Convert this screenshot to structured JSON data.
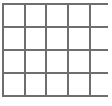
{
  "figure": {
    "name": "blank-grid-table",
    "background_color": "#ffffff",
    "width": 112,
    "height": 106
  },
  "grid": {
    "columns": 5,
    "rows": 4,
    "line_color": "#6e6e6e",
    "line_width": 2,
    "cell_fill": "#ffffff",
    "right_edge_open": true,
    "vertical_line_x": [
      3,
      24.5,
      46,
      67.5,
      89.5
    ],
    "horizontal_line_y": [
      3.5,
      26.5,
      50,
      73,
      96
    ],
    "horizontal_line_x_start": 2,
    "horizontal_line_x_end": 108,
    "vertical_line_y_start": 2.5,
    "vertical_line_y_end": 97,
    "cells": [
      [
        "",
        "",
        "",
        "",
        ""
      ],
      [
        "",
        "",
        "",
        "",
        ""
      ],
      [
        "",
        "",
        "",
        "",
        ""
      ],
      [
        "",
        "",
        "",
        "",
        ""
      ]
    ]
  }
}
